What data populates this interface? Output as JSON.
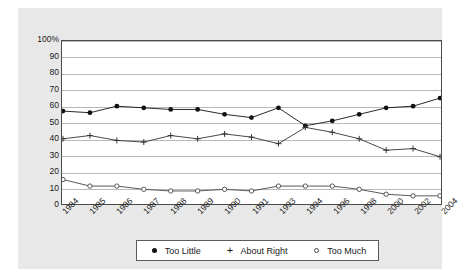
{
  "chart_data": {
    "type": "line",
    "title": "",
    "xlabel": "",
    "ylabel": "",
    "ylim": [
      0,
      100
    ],
    "yticks": [
      "0",
      "10",
      "20",
      "30",
      "40",
      "50",
      "60",
      "70",
      "80",
      "90",
      "100%"
    ],
    "grid": true,
    "legend_position": "bottom",
    "categories": [
      "1984",
      "1985",
      "1986",
      "1987",
      "1988",
      "1989",
      "1990",
      "1991",
      "1993",
      "1994",
      "1996",
      "1998",
      "2000",
      "2002",
      "2004"
    ],
    "series": [
      {
        "name": "Too Little",
        "marker": "filled-circle",
        "color": "#111111",
        "values": [
          57,
          56,
          60,
          59,
          58,
          58,
          55,
          53,
          59,
          48,
          51,
          55,
          59,
          60,
          65
        ]
      },
      {
        "name": "About Right",
        "marker": "plus",
        "color": "#333333",
        "values": [
          40,
          42,
          39,
          38,
          42,
          40,
          43,
          41,
          37,
          47,
          44,
          40,
          33,
          34,
          29
        ]
      },
      {
        "name": "Too Much",
        "marker": "open-circle",
        "color": "#444444",
        "values": [
          15,
          11,
          11,
          9,
          8,
          8,
          9,
          8,
          11,
          11,
          11,
          9,
          6,
          5,
          5
        ]
      }
    ]
  },
  "legend": {
    "entries": [
      {
        "label": "Too Little",
        "marker": "filled-circle"
      },
      {
        "label": "About Right",
        "marker": "plus"
      },
      {
        "label": "Too Much",
        "marker": "open-circle"
      }
    ]
  },
  "colors": {
    "panel_background": "#e8e8e8",
    "plot_background": "#ffffff",
    "gridline": "#b9b9b9",
    "frame": "#4a4a4a",
    "text": "#1a1a1a"
  }
}
